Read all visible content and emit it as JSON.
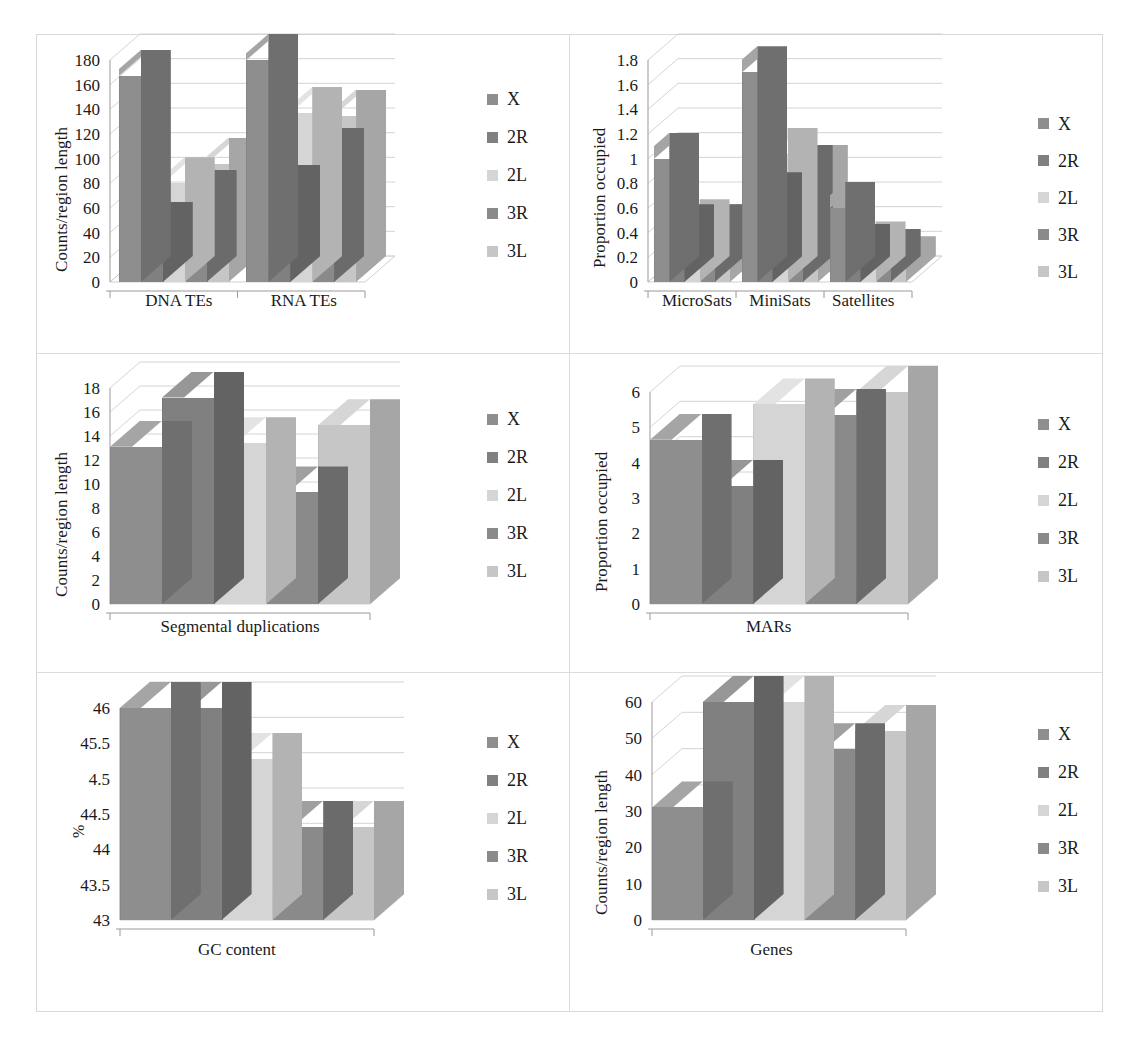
{
  "figure": {
    "layout": "2 columns x 3 rows of 3-D column charts",
    "series": [
      {
        "name": "X",
        "color": "#8e8e8e",
        "top": "#a5a5a5",
        "side": "#6f6f6f"
      },
      {
        "name": "2R",
        "color": "#808080",
        "top": "#979797",
        "side": "#636363"
      },
      {
        "name": "2L",
        "color": "#d5d5d5",
        "top": "#e3e3e3",
        "side": "#b3b3b3"
      },
      {
        "name": "3R",
        "color": "#8a8a8a",
        "top": "#a0a0a0",
        "side": "#6b6b6b"
      },
      {
        "name": "3L",
        "color": "#c6c6c6",
        "top": "#d6d6d6",
        "side": "#a6a6a6"
      }
    ],
    "legend_labels": [
      "X",
      "2R",
      "2L",
      "3R",
      "3L"
    ]
  },
  "chart_data": [
    {
      "id": "te",
      "type": "bar",
      "title": "",
      "xlabel": "",
      "ylabel": "Counts/region length",
      "categories": [
        "DNA TEs",
        "RNA TEs"
      ],
      "legend_position": "right",
      "grid": true,
      "ylim": [
        0,
        180
      ],
      "yticks": [
        "0",
        "20",
        "40",
        "60",
        "80",
        "100",
        "120",
        "140",
        "160",
        "180"
      ],
      "series": [
        {
          "name": "X",
          "values": [
            167,
            182
          ]
        },
        {
          "name": "2R",
          "values": [
            44,
            74
          ]
        },
        {
          "name": "2L",
          "values": [
            80,
            137
          ]
        },
        {
          "name": "3R",
          "values": [
            70,
            104
          ]
        },
        {
          "name": "3L",
          "values": [
            96,
            135
          ]
        }
      ]
    },
    {
      "id": "sats",
      "type": "bar",
      "title": "",
      "xlabel": "",
      "ylabel": "Proportion occupied",
      "categories": [
        "MicroSats",
        "MiniSats",
        "Satellites"
      ],
      "legend_position": "right",
      "grid": true,
      "ylim": [
        0,
        1.8
      ],
      "yticks": [
        "0",
        "0.2",
        "0.4",
        "0.6",
        "0.8",
        "1",
        "1.2",
        "1.4",
        "1.6",
        "1.8"
      ],
      "series": [
        {
          "name": "X",
          "values": [
            1.0,
            1.7,
            0.6
          ]
        },
        {
          "name": "2R",
          "values": [
            0.42,
            0.68,
            0.26
          ]
        },
        {
          "name": "2L",
          "values": [
            0.46,
            1.04,
            0.28
          ]
        },
        {
          "name": "3R",
          "values": [
            0.42,
            0.9,
            0.22
          ]
        },
        {
          "name": "3L",
          "values": [
            0.42,
            0.9,
            0.16
          ]
        }
      ]
    },
    {
      "id": "segdup",
      "type": "bar",
      "title": "",
      "xlabel": "",
      "ylabel": "Counts/region length",
      "categories": [
        "Segmental duplications"
      ],
      "legend_position": "right",
      "grid": true,
      "ylim": [
        0,
        18
      ],
      "yticks": [
        "0",
        "2",
        "4",
        "6",
        "8",
        "10",
        "12",
        "14",
        "16",
        "18"
      ],
      "series": [
        {
          "name": "X",
          "values": [
            13.1
          ]
        },
        {
          "name": "2R",
          "values": [
            17.2
          ]
        },
        {
          "name": "2L",
          "values": [
            13.4
          ]
        },
        {
          "name": "3R",
          "values": [
            9.3
          ]
        },
        {
          "name": "3L",
          "values": [
            14.9
          ]
        }
      ]
    },
    {
      "id": "mars",
      "type": "bar",
      "title": "",
      "xlabel": "",
      "ylabel": "Proportion occupied",
      "categories": [
        "MARs"
      ],
      "legend_position": "right",
      "grid": true,
      "ylim": [
        0,
        6
      ],
      "yticks": [
        "0",
        "1",
        "2",
        "3",
        "4",
        "5",
        "6"
      ],
      "series": [
        {
          "name": "X",
          "values": [
            4.65
          ]
        },
        {
          "name": "2R",
          "values": [
            3.35
          ]
        },
        {
          "name": "2L",
          "values": [
            5.65
          ]
        },
        {
          "name": "3R",
          "values": [
            5.35
          ]
        },
        {
          "name": "3L",
          "values": [
            6.15
          ]
        }
      ]
    },
    {
      "id": "gc",
      "type": "bar",
      "title": "",
      "xlabel": "",
      "ylabel": "%",
      "categories": [
        "GC content"
      ],
      "legend_position": "right",
      "grid": true,
      "ylim": [
        43,
        46
      ],
      "yticks": [
        "43",
        "43.5",
        "44",
        "44.5",
        "4.5",
        "45.5",
        "46"
      ],
      "series": [
        {
          "name": "X",
          "values": [
            46.05
          ]
        },
        {
          "name": "2R",
          "values": [
            46.05
          ]
        },
        {
          "name": "2L",
          "values": [
            45.28
          ]
        },
        {
          "name": "3R",
          "values": [
            44.32
          ]
        },
        {
          "name": "3L",
          "values": [
            44.32
          ]
        }
      ]
    },
    {
      "id": "genes",
      "type": "bar",
      "title": "",
      "xlabel": "",
      "ylabel": "Counts/region length",
      "categories": [
        "Genes"
      ],
      "legend_position": "right",
      "grid": true,
      "ylim": [
        0,
        60
      ],
      "yticks": [
        "0",
        "10",
        "20",
        "30",
        "40",
        "50",
        "60"
      ],
      "series": [
        {
          "name": "X",
          "values": [
            31
          ]
        },
        {
          "name": "2R",
          "values": [
            63
          ]
        },
        {
          "name": "2L",
          "values": [
            62
          ]
        },
        {
          "name": "3R",
          "values": [
            47
          ]
        },
        {
          "name": "3L",
          "values": [
            52
          ]
        }
      ]
    }
  ]
}
